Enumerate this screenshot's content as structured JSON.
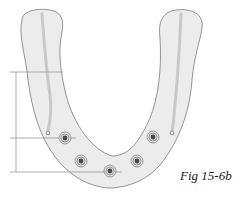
{
  "figure": {
    "caption": "Fig 15-6b",
    "colors": {
      "arch_fill": "#ececec",
      "arch_outline": "#7a7a7a",
      "canal": "#c8c8c8",
      "implant_ring": "#8a8a8a",
      "implant_core": "#4a4a4a",
      "dimension_line": "#8c8c8c"
    },
    "implants": [
      {
        "cx": 65,
        "cy": 138
      },
      {
        "cx": 81,
        "cy": 161
      },
      {
        "cx": 110,
        "cy": 171
      },
      {
        "cx": 137,
        "cy": 161
      },
      {
        "cx": 153,
        "cy": 137
      }
    ],
    "mental_foramina": [
      {
        "cx": 48,
        "cy": 133
      },
      {
        "cx": 172,
        "cy": 133
      }
    ],
    "dimension_lines": [
      {
        "y": 72,
        "x1": 10,
        "x2": 63
      },
      {
        "y": 138,
        "x1": 10,
        "x2": 76
      },
      {
        "y": 172,
        "x1": 10,
        "x2": 122
      }
    ]
  }
}
